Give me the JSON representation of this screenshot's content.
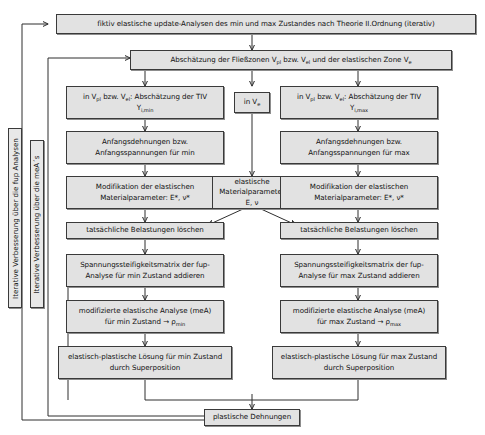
{
  "diagram": {
    "nodes": {
      "header": "fiktiv elastische update-Analysen des min und max Zustandes nach Theorie II.Ordnung (iterativ)",
      "zones": "Abschätzung der Fließzonen V<sub>pl</sub> bzw. V<sub>el</sub> und der elastischen Zone V<sub>e</sub>",
      "tiv_min": "in V<sub>pl</sub> bzw. V<sub>el</sub>: Abschätzung der TIV<br>Y<sub>i,min</sub>",
      "tiv_max": "in V<sub>pl</sub> bzw. V<sub>el</sub>: Abschätzung der TIV<br>Y<sub>i,max</sub>",
      "in_ve": "in V<sub>e</sub>",
      "anfang_min": "Anfangsdehnungen bzw.<br>Anfangsspannungen für min",
      "anfang_max": "Anfangsdehnungen bzw.<br>Anfangsspannungen für max",
      "modif_min": "Modifikation der elastischen<br>Materialparameter: E*, ν*",
      "modif_max": "Modifikation der elastischen<br>Materialparameter: E*, ν*",
      "elast_mat": "elastische<br>Materialparameter E, ν",
      "loeschen_min": "tatsächliche Belastungen löschen",
      "loeschen_max": "tatsächliche Belastungen löschen",
      "steif_min": "Spannungssteifigkeitsmatrix der fup-<br>Analyse für min Zustand addieren",
      "steif_max": "Spannungssteifigkeitsmatrix der fup-<br>Analyse für max Zustand addieren",
      "mea_min": "modifizierte elastische Analyse (meA)<br>für min Zustand → ρ<sub>min</sub>",
      "mea_max": "modifizierte elastische Analyse (meA)<br>für max Zustand → ρ<sub>max</sub>",
      "loesung_min": "elastisch-plastische Lösung für min Zustand<br>durch Superposition",
      "loesung_max": "elastisch-plastische Lösung für max Zustand<br>durch Superposition",
      "result": "plastische Dehnungen"
    },
    "loop_labels": {
      "outer": "Iterative Verbesserung über die fup Analysen",
      "inner": "Iterative Verbesserung über die meA´s"
    },
    "colors": {
      "box_fill": "#e2e2e2",
      "box_border": "#3a3a3a",
      "connector": "#2e2e2e",
      "page_background": "#ffffff"
    }
  }
}
